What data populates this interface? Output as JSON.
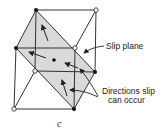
{
  "diagram": {
    "type": "crystal-lattice-slip-system",
    "labels": {
      "slip_plane": "Slip plane",
      "directions_line1": "Directions slip",
      "directions_line2": "can occur",
      "caption": "c"
    },
    "colors": {
      "line": "#333333",
      "plane_fill": "#d9d9d9",
      "background": "#ffffff"
    },
    "nodes": {
      "filled": [
        [
          36,
          10
        ],
        [
          16,
          48
        ],
        [
          95,
          72
        ],
        [
          74,
          109
        ],
        [
          54,
          60
        ]
      ],
      "open": [
        [
          96,
          10
        ],
        [
          75,
          48
        ],
        [
          35,
          71
        ],
        [
          14,
          109
        ]
      ]
    }
  }
}
